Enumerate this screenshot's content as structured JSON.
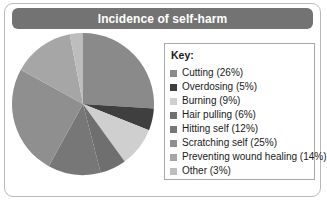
{
  "header": {
    "title": "Incidence of self-harm"
  },
  "legend": {
    "title": "Key:"
  },
  "chart_data": {
    "type": "pie",
    "title": "Incidence of self-harm",
    "xlabel": "",
    "ylabel": "",
    "legend_position": "right",
    "legend_title": "Key:",
    "categories": [
      "Cutting",
      "Overdosing",
      "Burning",
      "Hair pulling",
      "Hitting self",
      "Scratching self",
      "Preventing wound healing",
      "Other"
    ],
    "values": [
      26,
      5,
      9,
      6,
      12,
      25,
      14,
      3
    ],
    "unit": "%",
    "total": 100,
    "start_angle_deg": 0,
    "direction": "clockwise",
    "slices": [
      {
        "label": "Cutting (26%)",
        "name": "Cutting",
        "value": 26,
        "color": "#8a8a8a"
      },
      {
        "label": "Overdosing (5%)",
        "name": "Overdosing",
        "value": 5,
        "color": "#3f3f3f"
      },
      {
        "label": "Burning (9%)",
        "name": "Burning",
        "value": 9,
        "color": "#cfcfcf"
      },
      {
        "label": "Hair pulling (6%)",
        "name": "Hair pulling",
        "value": 6,
        "color": "#6f6f6f"
      },
      {
        "label": "Hitting self (12%)",
        "name": "Hitting self",
        "value": 12,
        "color": "#777777"
      },
      {
        "label": "Scratching self (25%)",
        "name": "Scratching self",
        "value": 25,
        "color": "#8f8f8f"
      },
      {
        "label": "Preventing wound healing (14%)",
        "name": "Preventing wound healing",
        "value": 14,
        "color": "#a6a6a6"
      },
      {
        "label": "Other (3%)",
        "name": "Other",
        "value": 3,
        "color": "#bdbdbd"
      }
    ],
    "colors": {
      "title_bar": "#737373",
      "title_text": "#ffffff",
      "card_border": "#b9b9b9",
      "legend_border": "#a8a8a8",
      "background": "#ffffff"
    }
  }
}
